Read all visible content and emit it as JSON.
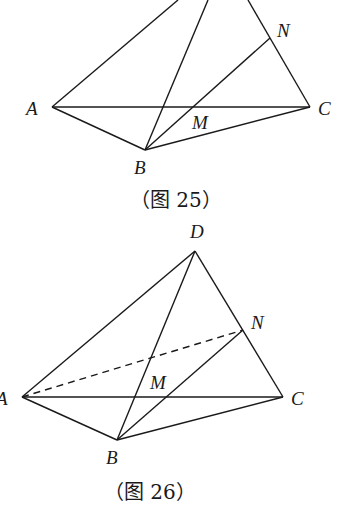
{
  "figures": [
    {
      "caption": "（图 25）",
      "labels": {
        "A": "A",
        "B": "B",
        "C": "C",
        "M": "M",
        "N": "N"
      }
    },
    {
      "caption": "（图 26）",
      "labels": {
        "A": "A",
        "B": "B",
        "C": "C",
        "D": "D",
        "M": "M",
        "N": "N"
      }
    }
  ]
}
